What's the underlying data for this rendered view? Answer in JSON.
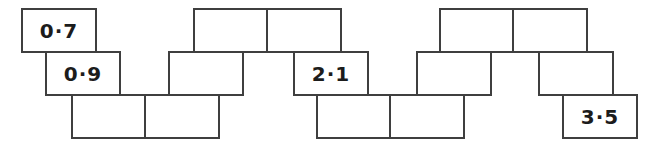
{
  "worksheet": {
    "colors": {
      "background": "#ffffff",
      "box_border": "#3f3f3f",
      "box_fill": "#ffffff",
      "text": "#1c1c1c"
    },
    "decimal_separator": "·",
    "visible_values": [
      "0·7",
      "0·9",
      "2·1",
      "3·5"
    ],
    "sequence_chain": {
      "box_count": 15,
      "boxes": [
        {
          "position": 1,
          "label": "0·7",
          "row": "top",
          "x": 21
        },
        {
          "position": 2,
          "label": "0·9",
          "row": "middle",
          "x": 45
        },
        {
          "position": 3,
          "label": "",
          "row": "bottom",
          "x": 71
        },
        {
          "position": 4,
          "label": "",
          "row": "bottom",
          "x": 144
        },
        {
          "position": 5,
          "label": "",
          "row": "middle",
          "x": 168
        },
        {
          "position": 6,
          "label": "",
          "row": "top",
          "x": 193
        },
        {
          "position": 7,
          "label": "",
          "row": "top",
          "x": 266
        },
        {
          "position": 8,
          "label": "2·1",
          "row": "middle",
          "x": 293
        },
        {
          "position": 9,
          "label": "",
          "row": "bottom",
          "x": 316
        },
        {
          "position": 10,
          "label": "",
          "row": "bottom",
          "x": 389
        },
        {
          "position": 11,
          "label": "",
          "row": "middle",
          "x": 416
        },
        {
          "position": 12,
          "label": "",
          "row": "top",
          "x": 439
        },
        {
          "position": 13,
          "label": "",
          "row": "top",
          "x": 512
        },
        {
          "position": 14,
          "label": "",
          "row": "middle",
          "x": 538
        },
        {
          "position": 15,
          "label": "3·5",
          "row": "bottom",
          "x": 562
        }
      ]
    }
  }
}
